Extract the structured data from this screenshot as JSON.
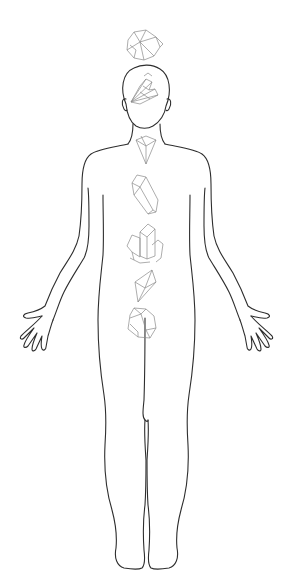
{
  "figure": {
    "title": "Human body outline with chakra crystals",
    "colors": {
      "background": "#ffffff",
      "outline": "#2e2e2e",
      "crystal_stroke": "#8a8a8a"
    },
    "crystals": [
      {
        "position": "crown",
        "shape": "crystal-cluster",
        "label": "crown-crystal"
      },
      {
        "position": "third-eye",
        "shape": "fanned-cluster",
        "label": "forehead-crystal"
      },
      {
        "position": "throat",
        "shape": "inverted-pyramid",
        "label": "throat-crystal"
      },
      {
        "position": "heart",
        "shape": "single-point",
        "label": "heart-crystal"
      },
      {
        "position": "solar-plexus",
        "shape": "cluster",
        "label": "solar-plexus-crystal"
      },
      {
        "position": "sacral",
        "shape": "octahedron",
        "label": "sacral-crystal"
      },
      {
        "position": "root",
        "shape": "tumbled-block",
        "label": "root-crystal"
      }
    ]
  }
}
